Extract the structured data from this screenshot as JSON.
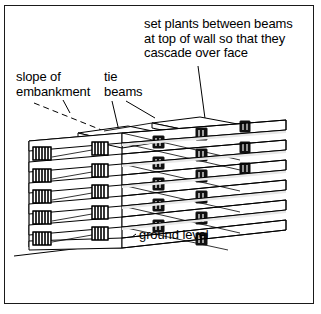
{
  "figure": {
    "background_color": "#ffffff",
    "ink_color": "#000000",
    "frame_color": "#1a1a1a"
  },
  "annotations": {
    "plants": {
      "line1": "set plants between beams",
      "line2": "at top of wall so that they",
      "line3": "cascade over face"
    },
    "slope": {
      "line1": "slope of",
      "line2": "embankment"
    },
    "tie": {
      "line1": "tie",
      "line2": "beams"
    },
    "ground": {
      "line1": "ground level"
    }
  },
  "drawing": {
    "subject": "timber crib wall",
    "view": "axonometric",
    "courses": 6,
    "front_face_beam_ends": 5,
    "style": "black and white line drawing"
  }
}
